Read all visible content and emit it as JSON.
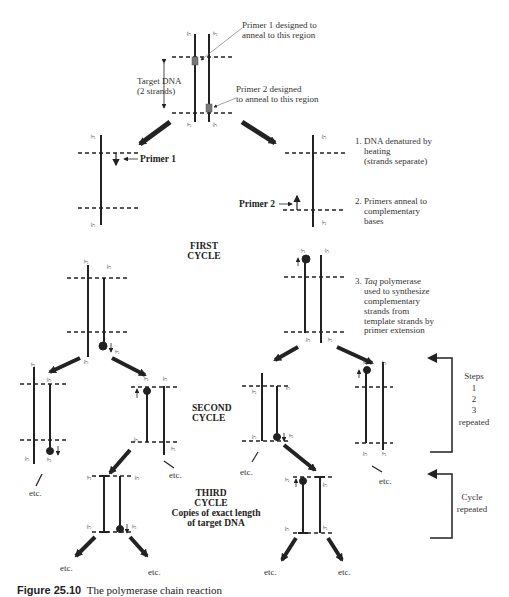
{
  "figure": {
    "caption_number": "Figure 25.10",
    "caption_text": "The polymerase chain reaction"
  },
  "top": {
    "primer1_note_line1": "Primer 1 designed to",
    "primer1_note_line2": "anneal to this region",
    "primer2_note_line1": "Primer 2 designed",
    "primer2_note_line2": "to anneal to this region",
    "target_line1": "Target DNA",
    "target_line2": "(2 strands)"
  },
  "labels": {
    "primer1": "Primer 1",
    "primer2": "Primer 2",
    "five_prime": "5'",
    "three_prime": "3'",
    "etc": "etc."
  },
  "steps": {
    "s1_line1": "1. DNA denatured by",
    "s1_line2": "heating",
    "s1_line3": "(strands separate)",
    "s2_line1": "2. Primers anneal to",
    "s2_line2": "complementary",
    "s2_line3": "bases",
    "s3_num": "3.",
    "s3_taq": "Taq",
    "s3_line1_rest": " polymerase",
    "s3_line2": "used to synthesize",
    "s3_line3": "complementary",
    "s3_line4": "strands from",
    "s3_line5": "template strands by",
    "s3_line6": "primer extension"
  },
  "cycles": {
    "first_line1": "FIRST",
    "first_line2": "CYCLE",
    "second_line1": "SECOND",
    "second_line2": "CYCLE",
    "third_line1": "THIRD",
    "third_line2": "CYCLE",
    "third_line3": "Copies of exact length",
    "third_line4": "of target DNA"
  },
  "brackets": {
    "steps_line1": "Steps",
    "steps_line2": "1",
    "steps_line3": "2",
    "steps_line4": "3",
    "steps_line5": "repeated",
    "cycle_line1": "Cycle",
    "cycle_line2": "repeated"
  },
  "colors": {
    "ink": "#222222",
    "text": "#333333",
    "primer_box": "#777777"
  }
}
